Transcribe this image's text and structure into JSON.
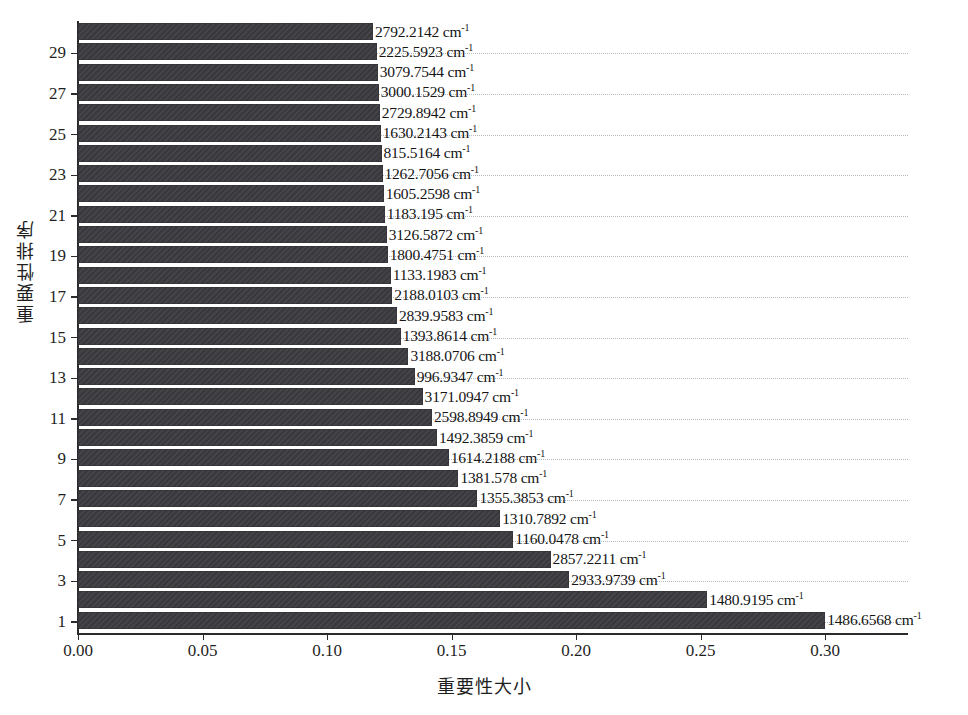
{
  "chart_data": {
    "type": "bar",
    "orientation": "horizontal",
    "title": "",
    "xlabel": "重要性大小",
    "ylabel": "重要性排序",
    "xlim": [
      0.0,
      0.3336
    ],
    "xticks": [
      0.0,
      0.05,
      0.1,
      0.15,
      0.2,
      0.25,
      0.3
    ],
    "xtick_labels": [
      "0.00",
      "0.05",
      "0.10",
      "0.15",
      "0.20",
      "0.25",
      "0.30"
    ],
    "yticks": [
      1,
      3,
      5,
      7,
      9,
      11,
      13,
      15,
      17,
      19,
      21,
      23,
      25,
      27,
      29
    ],
    "ytick_labels": [
      "1",
      "3",
      "5",
      "7",
      "9",
      "11",
      "13",
      "15",
      "17",
      "19",
      "21",
      "23",
      "25",
      "27",
      "29"
    ],
    "ylim": [
      0.5,
      30.5
    ],
    "grid": "dotted-horizontal-at-odd-ranks",
    "legend": "none",
    "bar_color": "#3b3b40",
    "unit_suffix": "cm",
    "unit_exponent": "-1",
    "categories": [
      "1486.6568",
      "1480.9195",
      "2933.9739",
      "2857.2211",
      "1160.0478",
      "1310.7892",
      "1355.3853",
      "1381.578",
      "1614.2188",
      "1492.3859",
      "2598.8949",
      "3171.0947",
      "996.9347",
      "3188.0706",
      "1393.8614",
      "2839.9583",
      "2188.0103",
      "1133.1983",
      "1800.4751",
      "3126.5872",
      "1183.195",
      "1605.2598",
      "1262.7056",
      "815.5164",
      "1630.2143",
      "2729.8942",
      "3000.1529",
      "3079.7544",
      "2225.5923",
      "2792.2142"
    ],
    "values": [
      0.3001,
      0.2527,
      0.1973,
      0.1898,
      0.1748,
      0.1696,
      0.1604,
      0.1528,
      0.1489,
      0.1442,
      0.1422,
      0.1384,
      0.1352,
      0.1327,
      0.1296,
      0.1281,
      0.1262,
      0.1256,
      0.1244,
      0.124,
      0.1232,
      0.1228,
      0.1223,
      0.1219,
      0.1216,
      0.1212,
      0.1208,
      0.1204,
      0.12,
      0.1185
    ],
    "ranks": [
      1,
      2,
      3,
      4,
      5,
      6,
      7,
      8,
      9,
      10,
      11,
      12,
      13,
      14,
      15,
      16,
      17,
      18,
      19,
      20,
      21,
      22,
      23,
      24,
      25,
      26,
      27,
      28,
      29,
      30
    ],
    "bars": [
      {
        "rank": 30,
        "label": "2792.2142",
        "value": 0.1185
      },
      {
        "rank": 29,
        "label": "2225.5923",
        "value": 0.12
      },
      {
        "rank": 28,
        "label": "3079.7544",
        "value": 0.1204
      },
      {
        "rank": 27,
        "label": "3000.1529",
        "value": 0.1208
      },
      {
        "rank": 26,
        "label": "2729.8942",
        "value": 0.1212
      },
      {
        "rank": 25,
        "label": "1630.2143",
        "value": 0.1216
      },
      {
        "rank": 24,
        "label": "815.5164",
        "value": 0.1219
      },
      {
        "rank": 23,
        "label": "1262.7056",
        "value": 0.1223
      },
      {
        "rank": 22,
        "label": "1605.2598",
        "value": 0.1228
      },
      {
        "rank": 21,
        "label": "1183.195",
        "value": 0.1232
      },
      {
        "rank": 20,
        "label": "3126.5872",
        "value": 0.124
      },
      {
        "rank": 19,
        "label": "1800.4751",
        "value": 0.1244
      },
      {
        "rank": 18,
        "label": "1133.1983",
        "value": 0.1256
      },
      {
        "rank": 17,
        "label": "2188.0103",
        "value": 0.1262
      },
      {
        "rank": 16,
        "label": "2839.9583",
        "value": 0.1281
      },
      {
        "rank": 15,
        "label": "1393.8614",
        "value": 0.1296
      },
      {
        "rank": 14,
        "label": "3188.0706",
        "value": 0.1327
      },
      {
        "rank": 13,
        "label": "996.9347",
        "value": 0.1352
      },
      {
        "rank": 12,
        "label": "3171.0947",
        "value": 0.1384
      },
      {
        "rank": 11,
        "label": "2598.8949",
        "value": 0.1422
      },
      {
        "rank": 10,
        "label": "1492.3859",
        "value": 0.1442
      },
      {
        "rank": 9,
        "label": "1614.2188",
        "value": 0.1489
      },
      {
        "rank": 8,
        "label": "1381.578",
        "value": 0.1528
      },
      {
        "rank": 7,
        "label": "1355.3853",
        "value": 0.1604
      },
      {
        "rank": 6,
        "label": "1310.7892",
        "value": 0.1696
      },
      {
        "rank": 5,
        "label": "1160.0478",
        "value": 0.1748
      },
      {
        "rank": 4,
        "label": "2857.2211",
        "value": 0.1898
      },
      {
        "rank": 3,
        "label": "2933.9739",
        "value": 0.1973
      },
      {
        "rank": 2,
        "label": "1480.9195",
        "value": 0.2527
      },
      {
        "rank": 1,
        "label": "1486.6568",
        "value": 0.3001
      }
    ]
  }
}
